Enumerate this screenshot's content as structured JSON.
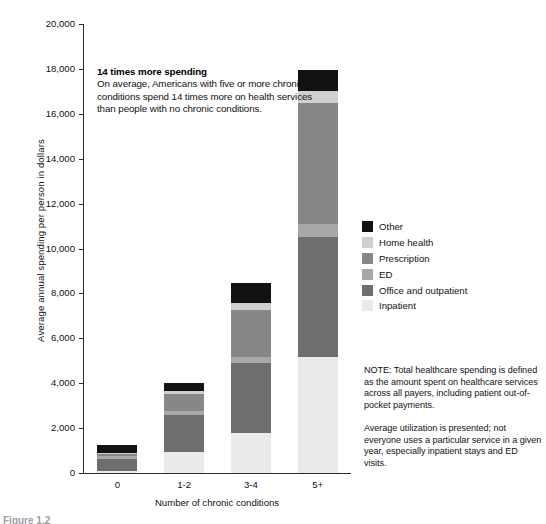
{
  "chart_data": {
    "type": "bar",
    "subtype": "stacked-bar",
    "title": "",
    "xlabel": "Number of chronic conditions",
    "ylabel": "Average annual spending per person in dollars",
    "categories": [
      "0",
      "1-2",
      "3-4",
      "5+"
    ],
    "ylim": [
      0,
      20000
    ],
    "yticks": [
      0,
      2000,
      4000,
      6000,
      8000,
      10000,
      12000,
      14000,
      16000,
      18000,
      20000
    ],
    "ytick_labels": [
      "0",
      "2,000",
      "4,000",
      "6,000",
      "8,000",
      "10,000",
      "12,000",
      "14,000",
      "16,000",
      "18,000",
      "20,000"
    ],
    "grid": false,
    "legend_position": "right",
    "stack_order_bottom_to_top": [
      "Inpatient",
      "Office and outpatient",
      "ED",
      "Prescription",
      "Home health",
      "Other"
    ],
    "series": [
      {
        "name": "Inpatient",
        "color": "#eaeaea",
        "values": [
          100,
          940,
          1790,
          5150
        ]
      },
      {
        "name": "Office and outpatient",
        "color": "#6e6e6e",
        "values": [
          540,
          1655,
          3130,
          5370
        ]
      },
      {
        "name": "ED",
        "color": "#a8a8a8",
        "values": [
          110,
          180,
          250,
          580
        ]
      },
      {
        "name": "Prescription",
        "color": "#878787",
        "values": [
          130,
          760,
          2100,
          5370
        ]
      },
      {
        "name": "Home health",
        "color": "#cfcfcf",
        "values": [
          25,
          135,
          310,
          540
        ]
      },
      {
        "name": "Other",
        "color": "#121212",
        "values": [
          345,
          358,
          895,
          940
        ]
      }
    ],
    "totals": [
      1250,
      4028,
      8475,
      17950
    ],
    "annotations": [
      {
        "title": "14 times more spending",
        "text": "On average, Americans with five or more chronic conditions spend 14 times more on health services than people with no chronic conditions."
      }
    ],
    "notes": [
      "NOTE: Total healthcare spending is defined as the amount spent on healthcare services across all payers, including patient out-of-pocket payments.",
      "Average utilization is presented; not everyone uses a particular service in a given year, especially inpatient stays and ED visits."
    ]
  },
  "axes": {
    "y": {
      "title": "Average annual spending per person in dollars",
      "ticks": [
        {
          "label": "20,000",
          "value": 20000
        },
        {
          "label": "18,000",
          "value": 18000
        },
        {
          "label": "16,000",
          "value": 16000
        },
        {
          "label": "14,000",
          "value": 14000
        },
        {
          "label": "12,000",
          "value": 12000
        },
        {
          "label": "10,000",
          "value": 10000
        },
        {
          "label": "8,000",
          "value": 8000
        },
        {
          "label": "6,000",
          "value": 6000
        },
        {
          "label": "4,000",
          "value": 4000
        },
        {
          "label": "2,000",
          "value": 2000
        },
        {
          "label": "0",
          "value": 0
        }
      ]
    },
    "x": {
      "title": "Number of chronic conditions",
      "ticks": [
        {
          "label": "0"
        },
        {
          "label": "1-2"
        },
        {
          "label": "3-4"
        },
        {
          "label": "5+"
        }
      ]
    }
  },
  "callout": {
    "title": "14 times more spending",
    "body": "On average, Americans with five or more chronic conditions spend 14 times more on health services than people with no chronic conditions."
  },
  "legend": {
    "items": [
      {
        "label": "Other",
        "color": "#121212"
      },
      {
        "label": "Home health",
        "color": "#cfcfcf"
      },
      {
        "label": "Prescription",
        "color": "#878787"
      },
      {
        "label": "ED",
        "color": "#a8a8a8"
      },
      {
        "label": "Office and outpatient",
        "color": "#6e6e6e"
      },
      {
        "label": "Inpatient",
        "color": "#eaeaea"
      }
    ]
  },
  "notes": {
    "paragraphs": [
      "NOTE: Total healthcare spending is defined as the amount spent on healthcare services across all payers, including patient out-of-pocket payments.",
      "Average utilization is presented; not everyone uses a particular service in a given year, especially inpatient stays and ED visits."
    ]
  },
  "caption": {
    "text": "Figure 1.2"
  }
}
